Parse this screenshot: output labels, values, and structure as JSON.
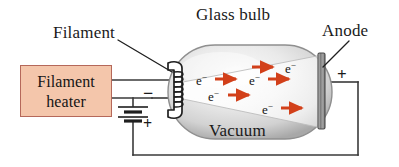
{
  "figure": {
    "type": "physics-diagram",
    "background_color": "#ffffff"
  },
  "labels": {
    "glass_bulb": "Glass bulb",
    "filament": "Filament",
    "anode": "Anode",
    "vacuum": "Vacuum"
  },
  "heater": {
    "line1": "Filament",
    "line2": "heater",
    "fill_color": "#f4c6ab",
    "border_color": "#b5685a"
  },
  "battery": {
    "negative_sign": "−",
    "positive_sign": "+"
  },
  "anode_terminal": {
    "positive_sign": "+"
  },
  "electrons": {
    "symbol": "e",
    "charge": "−",
    "count": 5,
    "arrow_color": "#d2401a",
    "items": [
      {
        "label": "e",
        "charge": "−",
        "x": 196,
        "y": 74,
        "arrow_x": 215,
        "arrow_y": 79,
        "arrow_len": 26
      },
      {
        "label": "e",
        "charge": "−",
        "x": 285,
        "y": 62,
        "arrow_x": 252,
        "arrow_y": 67,
        "arrow_len": 26
      },
      {
        "label": "e",
        "charge": "−",
        "x": 208,
        "y": 90,
        "arrow_x": 228,
        "arrow_y": 95,
        "arrow_len": 26
      },
      {
        "label": "e",
        "charge": "−",
        "x": 249,
        "y": 74,
        "arrow_x": 268,
        "arrow_y": 79,
        "arrow_len": 26
      },
      {
        "label": "e",
        "charge": "−",
        "x": 262,
        "y": 103,
        "arrow_x": 281,
        "arrow_y": 108,
        "arrow_len": 26
      }
    ]
  },
  "colors": {
    "wire": "#3a3a3a",
    "glass_light": "#f2f2f2",
    "glass_mid": "#d8d8d8",
    "glass_edge": "#9a9a9a",
    "anode_plate": "#8c8c8c",
    "beam": "#fbfbfb",
    "text": "#141414"
  }
}
